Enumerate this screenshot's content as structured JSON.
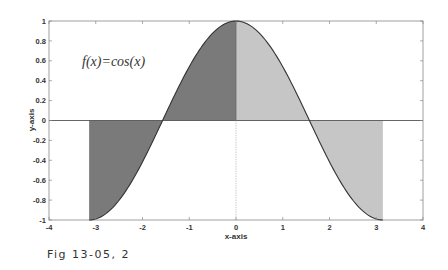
{
  "figure": {
    "caption": "Fig 13-05, 2"
  },
  "colors": {
    "dark_fill": "#7a7a7a",
    "light_fill": "#c6c6c6",
    "curve": "#333333",
    "axis": "#555555",
    "frame": "#888888"
  },
  "chart_data": {
    "type": "area",
    "title": "",
    "annotation": "f(x)=cos(x)",
    "xlabel": "x-axis",
    "ylabel": "y-axis",
    "xlim": [
      -4,
      4
    ],
    "ylim": [
      -1,
      1
    ],
    "grid": false,
    "legend": null,
    "x_ticks": [
      -4,
      -3,
      -2,
      -1,
      0,
      1,
      2,
      3,
      4
    ],
    "y_ticks": [
      -1,
      -0.8,
      -0.6,
      -0.4,
      -0.2,
      0,
      0.2,
      0.4,
      0.6,
      0.8,
      1
    ],
    "x_tick_labels": [
      "-4",
      "-3",
      "-2",
      "-1",
      "0",
      "1",
      "2",
      "3",
      "4"
    ],
    "y_tick_labels": [
      "-1",
      "-0.8",
      "-0.6",
      "-0.4",
      "-0.2",
      "0",
      "0.2",
      "0.4",
      "0.6",
      "0.8",
      "1"
    ],
    "series": [
      {
        "name": "cos(x)",
        "function": "cos(x)",
        "domain": [
          -3.1416,
          3.1416
        ],
        "x": [
          -3.1416,
          -2.5,
          -2.0,
          -1.5708,
          -1.0,
          -0.5,
          0,
          0.5,
          1.0,
          1.5708,
          2.0,
          2.5,
          3.1416
        ],
        "values": [
          -1.0,
          -0.801,
          -0.416,
          0.0,
          0.54,
          0.878,
          1.0,
          0.878,
          0.54,
          0.0,
          -0.416,
          -0.801,
          -1.0
        ]
      }
    ],
    "shaded_regions": [
      {
        "from": -3.1416,
        "to": 0,
        "fill": "dark",
        "description": "area between cos(x) and y=0 on [-pi, 0]"
      },
      {
        "from": 0,
        "to": 3.1416,
        "fill": "light",
        "description": "area between cos(x) and y=0 on [0, pi]"
      }
    ]
  }
}
